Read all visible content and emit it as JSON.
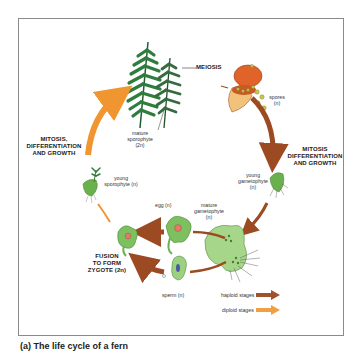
{
  "diagram": {
    "title": "Life cycle of a fern",
    "stages": {
      "meiosis": "MEIOSIS",
      "mitosis_top_left": [
        "MITOSIS,",
        "DIFFERENTIATION",
        "AND GROWTH"
      ],
      "mitosis_right": [
        "MITOSIS",
        "DIFFERENTIATION",
        "AND GROWTH"
      ],
      "fusion": [
        "FUSION",
        "TO FORM",
        "ZYGOTE (2n)"
      ]
    },
    "labels": {
      "mature_sporophyte": [
        "mature",
        "sporophyte",
        "(2n)"
      ],
      "spores": [
        "spores",
        "(n)"
      ],
      "young_gametophyte": [
        "young",
        "gametophyte",
        "(n)"
      ],
      "mature_gametophyte": [
        "mature",
        "gametophyte",
        "(n)"
      ],
      "egg": "egg (n)",
      "sperm": "sperm (n)",
      "young_sporophyte": [
        "young",
        "sporophyte (n)"
      ]
    },
    "legend": {
      "haploid": {
        "label": "haploid stages",
        "color": "#a0522d"
      },
      "diploid": {
        "label": "diploid stages",
        "color": "#f0a040"
      }
    },
    "caption": "(a) The life cycle of a fern"
  }
}
